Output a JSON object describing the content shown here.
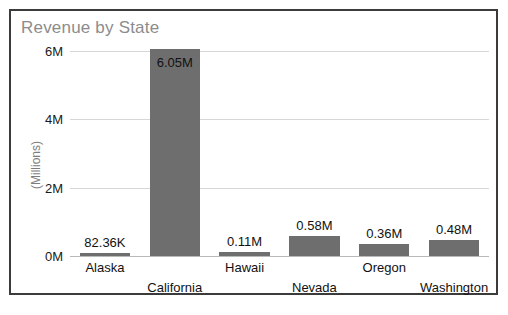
{
  "chart_data": {
    "type": "bar",
    "title": "Revenue by State",
    "xlabel": "",
    "ylabel": "(Millions)",
    "categories": [
      "Alaska",
      "California",
      "Hawaii",
      "Nevada",
      "Oregon",
      "Washington"
    ],
    "values": [
      0.08236,
      6.05,
      0.11,
      0.58,
      0.36,
      0.48
    ],
    "data_labels": [
      "82.36K",
      "6.05M",
      "0.11M",
      "0.58M",
      "0.36M",
      "0.48M"
    ],
    "ylim": [
      0,
      6
    ],
    "yticks": [
      0,
      2,
      4,
      6
    ],
    "ytick_labels": [
      "0M",
      "2M",
      "4M",
      "6M"
    ],
    "grid": true,
    "legend": "none",
    "bar_color": "#6e6e6e",
    "title_color": "#8c8c8c",
    "gridline_color": "#d6d6d6",
    "label_rows": [
      0,
      1,
      0,
      1,
      0,
      1
    ]
  }
}
